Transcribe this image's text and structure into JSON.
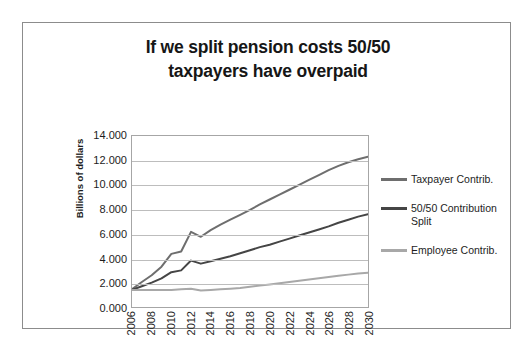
{
  "chart_data": {
    "type": "line",
    "title": "If we split pension costs 50/50 taxpayers have overpaid",
    "title_line1": "If we split pension costs 50/50",
    "title_line2": "taxpayers have overpaid",
    "xlabel": "",
    "ylabel": "Billions of dollars",
    "ylim": [
      0,
      14
    ],
    "ytick_labels": [
      "14.000",
      "12.000",
      "10.000",
      "8.000",
      "6.000",
      "4.000",
      "2.000",
      "0.000"
    ],
    "ytick_values": [
      14,
      12,
      10,
      8,
      6,
      4,
      2,
      0
    ],
    "xtick_labels": [
      "2006",
      "2008",
      "2010",
      "2012",
      "2014",
      "2016",
      "2018",
      "2020",
      "2022",
      "2024",
      "2026",
      "2028",
      "2030"
    ],
    "x": [
      2006,
      2007,
      2008,
      2009,
      2010,
      2011,
      2012,
      2013,
      2014,
      2015,
      2016,
      2017,
      2018,
      2019,
      2020,
      2021,
      2022,
      2023,
      2024,
      2025,
      2026,
      2027,
      2028,
      2029,
      2030
    ],
    "grid": true,
    "legend_position": "right",
    "series": [
      {
        "name": "Taxpayer Contrib.",
        "color": "#6e6e6e",
        "values": [
          1.45,
          2.05,
          2.6,
          3.3,
          4.35,
          4.55,
          6.15,
          5.75,
          6.3,
          6.75,
          7.15,
          7.55,
          7.95,
          8.4,
          8.8,
          9.2,
          9.6,
          10.0,
          10.4,
          10.8,
          11.2,
          11.55,
          11.85,
          12.1,
          12.3
        ]
      },
      {
        "name": "50/50 Contribution Split",
        "color": "#454545",
        "values": [
          1.4,
          1.7,
          2.0,
          2.35,
          2.85,
          3.0,
          3.8,
          3.55,
          3.75,
          3.95,
          4.15,
          4.4,
          4.65,
          4.9,
          5.1,
          5.35,
          5.6,
          5.85,
          6.1,
          6.35,
          6.6,
          6.9,
          7.15,
          7.4,
          7.6
        ]
      },
      {
        "name": "Employee Contrib.",
        "color": "#a8a8a8",
        "values": [
          1.4,
          1.4,
          1.4,
          1.4,
          1.4,
          1.45,
          1.5,
          1.35,
          1.4,
          1.45,
          1.5,
          1.55,
          1.65,
          1.75,
          1.85,
          1.95,
          2.05,
          2.15,
          2.25,
          2.35,
          2.45,
          2.55,
          2.65,
          2.75,
          2.8
        ]
      }
    ],
    "legend": [
      {
        "label_line1": "Taxpayer Contrib.",
        "label_line2": "",
        "color": "#6e6e6e"
      },
      {
        "label_line1": "50/50 Contribution",
        "label_line2": "Split",
        "color": "#454545"
      },
      {
        "label_line1": "Employee Contrib.",
        "label_line2": "",
        "color": "#a8a8a8"
      }
    ]
  },
  "colors": {
    "frame_border": "#8c8c8c",
    "gridline": "#bdbdbd",
    "axis": "#a6a6a6",
    "text": "#1d1d1d",
    "background": "#ffffff"
  }
}
